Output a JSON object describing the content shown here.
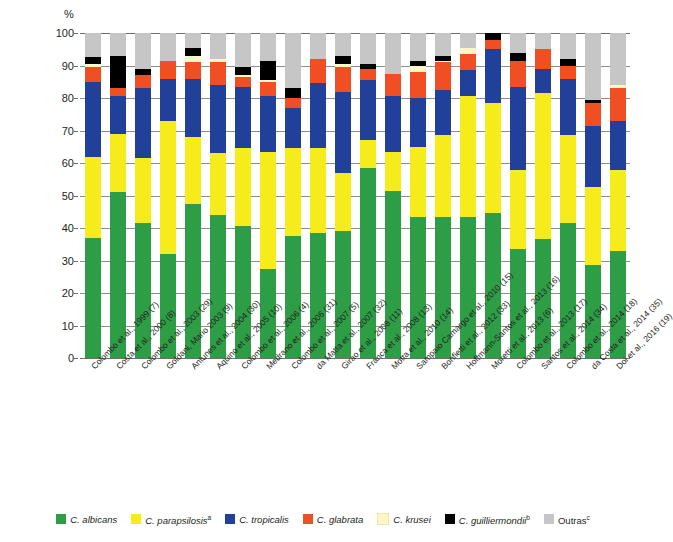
{
  "axis": {
    "y_unit": "%",
    "y_ticks": [
      "100",
      "90",
      "80",
      "70",
      "60",
      "50",
      "40",
      "30",
      "20",
      "10",
      "0"
    ]
  },
  "legend": {
    "items": [
      {
        "label": "C. albicans",
        "sup": "",
        "color": "#2e9e46",
        "italic": true
      },
      {
        "label": "C. parapsilosis",
        "sup": "a",
        "color": "#f6ec1b",
        "italic": true
      },
      {
        "label": "C. tropicalis",
        "sup": "",
        "color": "#21409a",
        "italic": true
      },
      {
        "label": "C. glabrata",
        "sup": "",
        "color": "#f04e23",
        "italic": true
      },
      {
        "label": "C. krusei",
        "sup": "",
        "color": "#fcf7c5",
        "italic": true
      },
      {
        "label": "C. guilliermondii",
        "sup": "b",
        "color": "#000000",
        "italic": true
      },
      {
        "label": "Outras",
        "sup": "c",
        "color": "#c6c6c6",
        "italic": false
      }
    ]
  },
  "chart_data": {
    "type": "bar",
    "stacked": true,
    "title": "",
    "xlabel": "",
    "ylabel": "%",
    "ylim": [
      0,
      100
    ],
    "grid": true,
    "legend_position": "bottom",
    "categories": [
      "Colombo et al., 1999 (7)",
      "Costa et al., 2000 (8)",
      "Colombo et al., 2003 (29)",
      "Goldani, Mario 2003 (9)",
      "Antunes et al., 2004 (30)",
      "Aquino et al., 2005 (10)",
      "Colombo et al., 2006 (4)",
      "Medrano et al., 2006 (31)",
      "Colombo et al., 2007 (5)",
      "da Matta et al., 2007 (32)",
      "Girao et al., 2008 (11)",
      "Franca et al., 2008 (13)",
      "Motta et al., 2010 (14)",
      "Sampaio Camargo et al., 2010 (15)",
      "Bonfietti et al., 2012 (33)",
      "Hoffmann-Santos et al., 2013 (16)",
      "Moretti et al., 2013 (6)",
      "Colombo et al., 2013 (17)",
      "Santos et al., 2014 (34)",
      "Colombo et al., 2014 (18)",
      "da Costa et al., 2014 (35)",
      "Doi et al., 2016 (19)"
    ],
    "series": [
      {
        "name": "C. albicans",
        "color": "#2e9e46",
        "values": [
          37,
          51,
          41.5,
          32,
          47.5,
          44,
          40.5,
          27.5,
          37.5,
          38.5,
          39,
          58.5,
          51.5,
          43.5,
          43.5,
          43.5,
          44.5,
          33.5,
          36.5,
          41.5,
          28.5,
          33
        ]
      },
      {
        "name": "C. parapsilosis",
        "color": "#f6ec1b",
        "values": [
          25,
          18,
          20,
          41,
          20.5,
          19,
          24,
          36,
          27,
          26,
          18,
          8.5,
          12,
          21.5,
          25,
          37,
          34,
          24.5,
          45,
          27,
          24,
          25
        ]
      },
      {
        "name": "C. tropicalis",
        "color": "#21409a",
        "values": [
          23,
          11.5,
          21.5,
          13,
          18,
          21,
          19,
          17,
          12.5,
          20,
          25,
          18.5,
          17,
          15,
          14,
          8,
          16.5,
          25.5,
          7.5,
          17.5,
          19,
          15
        ]
      },
      {
        "name": "C. glabrata",
        "color": "#f04e23",
        "values": [
          4.5,
          2.5,
          4,
          5.5,
          5,
          7,
          3,
          4.5,
          3,
          7.5,
          7.5,
          3.5,
          7,
          8,
          8.5,
          5,
          3,
          8,
          6,
          4,
          7,
          10
        ]
      },
      {
        "name": "C. krusei",
        "color": "#fcf7c5",
        "values": [
          1,
          0,
          0,
          0,
          2,
          1,
          0.5,
          0.5,
          0,
          0,
          1,
          0,
          0,
          2,
          0.5,
          2,
          0,
          0,
          0,
          0,
          0,
          1
        ]
      },
      {
        "name": "C. guilliermondii",
        "color": "#000000",
        "values": [
          2,
          10,
          2,
          0,
          2.5,
          0,
          2.5,
          6,
          3,
          0,
          2.5,
          1.5,
          0,
          1.5,
          1.5,
          0,
          2,
          2.5,
          0,
          2,
          1,
          0
        ]
      },
      {
        "name": "Outras",
        "color": "#c6c6c6",
        "values": [
          7.5,
          7,
          11,
          8.5,
          4.5,
          8,
          10.5,
          8.5,
          17,
          8,
          7,
          9.5,
          12.5,
          8.5,
          7,
          4.5,
          0,
          6,
          5,
          8,
          20.5,
          16
        ]
      }
    ]
  }
}
